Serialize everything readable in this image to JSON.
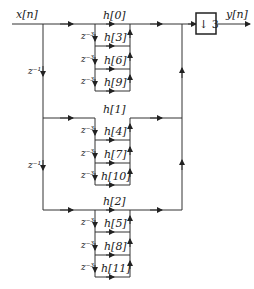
{
  "diagram": {
    "input_label": "x[n]",
    "output_label": "y[n]",
    "downsampler_label": "↓ 3",
    "outer_delay_labels": [
      "z⁻¹",
      "z⁻¹"
    ],
    "groups": [
      {
        "coefficients": [
          "h[0]",
          "h[3]",
          "h[6]",
          "h[9]"
        ],
        "delays": [
          "z⁻³",
          "z⁻³",
          "z⁻³"
        ]
      },
      {
        "coefficients": [
          "h[1]",
          "h[4]",
          "h[7]",
          "h[10]"
        ],
        "delays": [
          "z⁻³",
          "z⁻³",
          "z⁻³"
        ]
      },
      {
        "coefficients": [
          "h[2]",
          "h[5]",
          "h[8]",
          "h[11]"
        ],
        "delays": [
          "z⁻³",
          "z⁻³",
          "z⁻³"
        ]
      }
    ]
  }
}
